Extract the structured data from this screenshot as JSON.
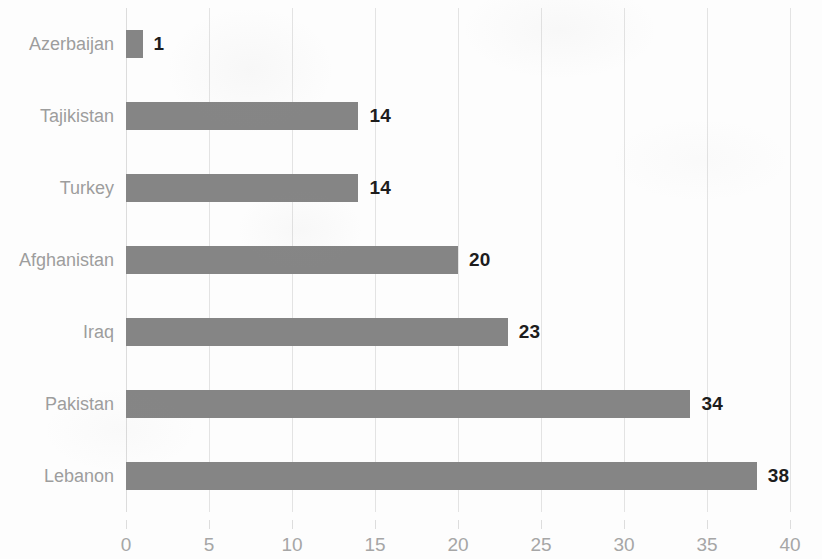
{
  "chart_data": {
    "type": "bar",
    "orientation": "horizontal",
    "title": "",
    "subtitle": "",
    "xlabel": "",
    "ylabel": "",
    "categories": [
      "Azerbaijan",
      "Tajikistan",
      "Turkey",
      "Afghanistan",
      "Iraq",
      "Pakistan",
      "Lebanon"
    ],
    "values": [
      1,
      14,
      14,
      20,
      23,
      34,
      38
    ],
    "data_labels": [
      "1",
      "14",
      "14",
      "20",
      "23",
      "34",
      "38"
    ],
    "xlim": [
      0,
      40
    ],
    "xticks": [
      0,
      5,
      10,
      15,
      20,
      25,
      30,
      35,
      40
    ],
    "xtick_labels": [
      "0",
      "5",
      "10",
      "15",
      "20",
      "25",
      "30",
      "35",
      "40"
    ],
    "grid": "vertical",
    "legend": "none",
    "bar_color": "#858585",
    "gridline_color": "#e3e3e3",
    "label_color": "#9d9d9d",
    "value_label_color": "#1d1d1d",
    "background_color": "#fdfdfd"
  }
}
